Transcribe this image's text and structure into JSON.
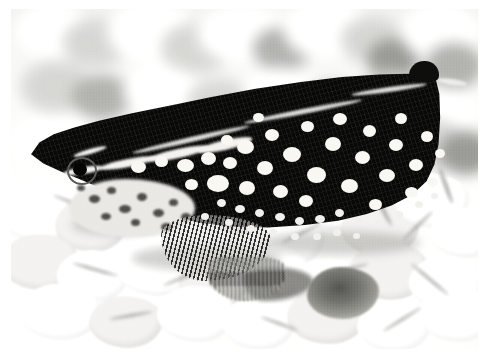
{
  "image": {
    "kind": "photograph",
    "medium": "black-and-white halftone print",
    "caption": "",
    "subject": "spotted fish resting on light aquarium gravel",
    "orientation": "landscape",
    "canvas": {
      "width": 494,
      "height": 363,
      "background": "#ffffff"
    },
    "plate": {
      "left": 11,
      "top": 9,
      "width": 467,
      "height": 340
    }
  },
  "palette": {
    "paper_white": "#ffffff",
    "gravel_white": "#fbfbfa",
    "gravel_midtone": "#cfcfcc",
    "gravel_shadow": "#8b8b87",
    "dark_pebble": "#6d6d68",
    "fish_body": "#0d0d0c",
    "fish_spot": "#f4f3ef",
    "fish_cheek": "#e6e5e1",
    "fin_ray": "#5c5b56"
  },
  "scene": {
    "background_label": "out-of-focus gravel",
    "foreground_label": "in-focus white gravel",
    "background_stones": [
      {
        "x": 4,
        "y": -6,
        "w": 74,
        "h": 56,
        "tone": "l"
      },
      {
        "x": 52,
        "y": 10,
        "w": 66,
        "h": 48,
        "tone": ""
      },
      {
        "x": 96,
        "y": -8,
        "w": 88,
        "h": 62,
        "tone": "l"
      },
      {
        "x": 150,
        "y": 14,
        "w": 70,
        "h": 50,
        "tone": ""
      },
      {
        "x": 186,
        "y": -4,
        "w": 92,
        "h": 58,
        "tone": "l"
      },
      {
        "x": 242,
        "y": 18,
        "w": 58,
        "h": 44,
        "tone": "d"
      },
      {
        "x": 272,
        "y": -10,
        "w": 86,
        "h": 60,
        "tone": "l"
      },
      {
        "x": 330,
        "y": 8,
        "w": 62,
        "h": 46,
        "tone": ""
      },
      {
        "x": 356,
        "y": 30,
        "w": 52,
        "h": 40,
        "tone": "dd"
      },
      {
        "x": 390,
        "y": -6,
        "w": 80,
        "h": 58,
        "tone": "l"
      },
      {
        "x": 414,
        "y": 34,
        "w": 58,
        "h": 46,
        "tone": "d"
      },
      {
        "x": 10,
        "y": 52,
        "w": 70,
        "h": 52,
        "tone": ""
      },
      {
        "x": 60,
        "y": 66,
        "w": 62,
        "h": 44,
        "tone": "d"
      },
      {
        "x": 112,
        "y": 56,
        "w": 76,
        "h": 52,
        "tone": "l"
      },
      {
        "x": 176,
        "y": 70,
        "w": 64,
        "h": 46,
        "tone": ""
      },
      {
        "x": 232,
        "y": 58,
        "w": 72,
        "h": 50,
        "tone": "l"
      },
      {
        "x": 292,
        "y": 74,
        "w": 58,
        "h": 44,
        "tone": "d"
      },
      {
        "x": 344,
        "y": 62,
        "w": 70,
        "h": 50,
        "tone": ""
      },
      {
        "x": 404,
        "y": 78,
        "w": 62,
        "h": 46,
        "tone": "l"
      },
      {
        "x": 2,
        "y": 104,
        "w": 84,
        "h": 54,
        "tone": "l"
      },
      {
        "x": 74,
        "y": 116,
        "w": 66,
        "h": 46,
        "tone": ""
      },
      {
        "x": 136,
        "y": 108,
        "w": 58,
        "h": 42,
        "tone": "d"
      },
      {
        "x": 382,
        "y": 110,
        "w": 74,
        "h": 52,
        "tone": ""
      },
      {
        "x": 428,
        "y": 122,
        "w": 54,
        "h": 44,
        "tone": "dd"
      }
    ],
    "foreground_pebbles": [
      {
        "x": -14,
        "y": 8,
        "w": 86,
        "h": 62,
        "shade": false
      },
      {
        "x": 44,
        "y": 26,
        "w": 72,
        "h": 54,
        "shade": true
      },
      {
        "x": 96,
        "y": 6,
        "w": 80,
        "h": 58,
        "shade": false
      },
      {
        "x": 150,
        "y": 34,
        "w": 76,
        "h": 56,
        "shade": false
      },
      {
        "x": 196,
        "y": 10,
        "w": 68,
        "h": 52,
        "shade": true
      },
      {
        "x": 240,
        "y": 40,
        "w": 74,
        "h": 54,
        "shade": false
      },
      {
        "x": 288,
        "y": 6,
        "w": 70,
        "h": 52,
        "shade": false
      },
      {
        "x": 330,
        "y": 28,
        "w": 78,
        "h": 56,
        "shade": true
      },
      {
        "x": 384,
        "y": 2,
        "w": 74,
        "h": 54,
        "shade": false
      },
      {
        "x": 420,
        "y": 36,
        "w": 66,
        "h": 50,
        "shade": false
      },
      {
        "x": -10,
        "y": 62,
        "w": 78,
        "h": 56,
        "shade": true
      },
      {
        "x": 46,
        "y": 78,
        "w": 72,
        "h": 52,
        "shade": false
      },
      {
        "x": 104,
        "y": 66,
        "w": 84,
        "h": 58,
        "shade": false
      },
      {
        "x": 168,
        "y": 84,
        "w": 70,
        "h": 52,
        "shade": true
      },
      {
        "x": 222,
        "y": 70,
        "w": 76,
        "h": 56,
        "shade": false
      },
      {
        "x": 282,
        "y": 86,
        "w": 72,
        "h": 52,
        "shade": false
      },
      {
        "x": 338,
        "y": 70,
        "w": 80,
        "h": 58,
        "shade": true
      },
      {
        "x": 398,
        "y": 84,
        "w": 74,
        "h": 54,
        "shade": false
      },
      {
        "x": 8,
        "y": 112,
        "w": 82,
        "h": 56,
        "shade": false
      },
      {
        "x": 78,
        "y": 124,
        "w": 74,
        "h": 52,
        "shade": true
      },
      {
        "x": 146,
        "y": 114,
        "w": 78,
        "h": 56,
        "shade": false
      },
      {
        "x": 212,
        "y": 126,
        "w": 72,
        "h": 52,
        "shade": false
      },
      {
        "x": 276,
        "y": 116,
        "w": 80,
        "h": 56,
        "shade": true
      },
      {
        "x": 346,
        "y": 128,
        "w": 74,
        "h": 52,
        "shade": false
      },
      {
        "x": 408,
        "y": 114,
        "w": 76,
        "h": 56,
        "shade": false
      }
    ],
    "pebble_seams": [
      {
        "x": 40,
        "y": 30,
        "w": 46,
        "h": 3,
        "rot": 22
      },
      {
        "x": 118,
        "y": 52,
        "w": 40,
        "h": 3,
        "rot": -18
      },
      {
        "x": 196,
        "y": 38,
        "w": 52,
        "h": 3,
        "rot": 12
      },
      {
        "x": 268,
        "y": 60,
        "w": 44,
        "h": 3,
        "rot": -26
      },
      {
        "x": 344,
        "y": 30,
        "w": 50,
        "h": 4,
        "rot": 62
      },
      {
        "x": 386,
        "y": 52,
        "w": 42,
        "h": 3,
        "rot": -44
      },
      {
        "x": 416,
        "y": 12,
        "w": 38,
        "h": 4,
        "rot": 70
      },
      {
        "x": 60,
        "y": 96,
        "w": 48,
        "h": 3,
        "rot": 16
      },
      {
        "x": 150,
        "y": 104,
        "w": 44,
        "h": 3,
        "rot": -22
      },
      {
        "x": 232,
        "y": 112,
        "w": 40,
        "h": 3,
        "rot": 30
      },
      {
        "x": 312,
        "y": 96,
        "w": 46,
        "h": 3,
        "rot": -14
      },
      {
        "x": 394,
        "y": 106,
        "w": 50,
        "h": 3,
        "rot": 40
      },
      {
        "x": 98,
        "y": 142,
        "w": 44,
        "h": 3,
        "rot": -10
      },
      {
        "x": 248,
        "y": 150,
        "w": 40,
        "h": 3,
        "rot": 20
      },
      {
        "x": 368,
        "y": 146,
        "w": 46,
        "h": 3,
        "rot": -32
      }
    ],
    "dark_pebble": {
      "x": 296,
      "y": 258,
      "w": 72,
      "h": 52
    },
    "contact_shadows": [
      {
        "x": 120,
        "y": 236,
        "w": 150,
        "h": 26
      },
      {
        "x": 250,
        "y": 222,
        "w": 160,
        "h": 24
      },
      {
        "x": 60,
        "y": 206,
        "w": 90,
        "h": 20
      }
    ]
  },
  "fish": {
    "label": "spotted fish",
    "body": {
      "x": 18,
      "y": 58,
      "w": 412,
      "h": 168,
      "color": "#0d0d0c"
    },
    "dorsal_lobe": {
      "x": 398,
      "y": 52,
      "w": 30,
      "h": 20
    },
    "dorsal_rim": [
      {
        "x": 120,
        "y": 128,
        "w": 120,
        "h": 5,
        "rot": -13
      },
      {
        "x": 232,
        "y": 100,
        "w": 120,
        "h": 5,
        "rot": -11
      },
      {
        "x": 340,
        "y": 78,
        "w": 76,
        "h": 5,
        "rot": -8
      },
      {
        "x": 426,
        "y": 70,
        "w": 30,
        "h": 6,
        "rot": 8
      }
    ],
    "head_stripes": [
      {
        "x": 52,
        "y": 158,
        "w": 40,
        "h": 7,
        "rot": -9,
        "label": "snout-bar"
      },
      {
        "x": 88,
        "y": 150,
        "w": 58,
        "h": 8,
        "rot": -11,
        "label": "supraorbital-stripe"
      },
      {
        "x": 136,
        "y": 140,
        "w": 62,
        "h": 9,
        "rot": -12,
        "label": "mid-lateral-stripe"
      },
      {
        "x": 186,
        "y": 131,
        "w": 56,
        "h": 10,
        "rot": -13,
        "label": "lateral-stripe-2"
      },
      {
        "x": 62,
        "y": 140,
        "w": 34,
        "h": 5,
        "rot": -16,
        "label": "upper-brow-stripe"
      }
    ],
    "cheek": {
      "x": 58,
      "y": 170,
      "w": 126,
      "h": 58
    },
    "cheek_mottles": [
      {
        "x": 78,
        "y": 186,
        "w": 11,
        "h": 8
      },
      {
        "x": 96,
        "y": 178,
        "w": 9,
        "h": 7
      },
      {
        "x": 108,
        "y": 196,
        "w": 12,
        "h": 8
      },
      {
        "x": 126,
        "y": 184,
        "w": 10,
        "h": 8
      },
      {
        "x": 142,
        "y": 200,
        "w": 11,
        "h": 8
      },
      {
        "x": 158,
        "y": 190,
        "w": 9,
        "h": 7
      },
      {
        "x": 90,
        "y": 204,
        "w": 10,
        "h": 7
      },
      {
        "x": 120,
        "y": 210,
        "w": 9,
        "h": 7
      },
      {
        "x": 150,
        "y": 214,
        "w": 11,
        "h": 8
      },
      {
        "x": 170,
        "y": 204,
        "w": 10,
        "h": 8
      },
      {
        "x": 66,
        "y": 176,
        "w": 8,
        "h": 6
      }
    ],
    "eye": {
      "ring_x": 56,
      "ring_y": 148,
      "ring_w": 26,
      "ring_h": 24,
      "pupil_x": 62,
      "pupil_y": 154,
      "pupil_w": 14,
      "pupil_h": 13
    },
    "spots": [
      {
        "x": 120,
        "y": 152,
        "w": 15,
        "h": 12
      },
      {
        "x": 144,
        "y": 147,
        "w": 13,
        "h": 11
      },
      {
        "x": 166,
        "y": 150,
        "w": 17,
        "h": 13
      },
      {
        "x": 190,
        "y": 143,
        "w": 15,
        "h": 13
      },
      {
        "x": 212,
        "y": 148,
        "w": 14,
        "h": 12
      },
      {
        "x": 196,
        "y": 166,
        "w": 22,
        "h": 17
      },
      {
        "x": 226,
        "y": 131,
        "w": 17,
        "h": 14
      },
      {
        "x": 246,
        "y": 152,
        "w": 16,
        "h": 14
      },
      {
        "x": 228,
        "y": 172,
        "w": 16,
        "h": 14
      },
      {
        "x": 254,
        "y": 120,
        "w": 14,
        "h": 12
      },
      {
        "x": 272,
        "y": 138,
        "w": 18,
        "h": 15
      },
      {
        "x": 262,
        "y": 176,
        "w": 15,
        "h": 13
      },
      {
        "x": 290,
        "y": 112,
        "w": 13,
        "h": 11
      },
      {
        "x": 296,
        "y": 158,
        "w": 19,
        "h": 16
      },
      {
        "x": 288,
        "y": 186,
        "w": 14,
        "h": 12
      },
      {
        "x": 314,
        "y": 128,
        "w": 16,
        "h": 14
      },
      {
        "x": 322,
        "y": 104,
        "w": 14,
        "h": 12
      },
      {
        "x": 330,
        "y": 170,
        "w": 17,
        "h": 14
      },
      {
        "x": 344,
        "y": 142,
        "w": 15,
        "h": 13
      },
      {
        "x": 352,
        "y": 116,
        "w": 13,
        "h": 12
      },
      {
        "x": 358,
        "y": 190,
        "w": 13,
        "h": 11
      },
      {
        "x": 368,
        "y": 160,
        "w": 16,
        "h": 13
      },
      {
        "x": 378,
        "y": 130,
        "w": 14,
        "h": 12
      },
      {
        "x": 384,
        "y": 104,
        "w": 12,
        "h": 11
      },
      {
        "x": 394,
        "y": 178,
        "w": 13,
        "h": 11
      },
      {
        "x": 398,
        "y": 150,
        "w": 14,
        "h": 12
      },
      {
        "x": 410,
        "y": 122,
        "w": 12,
        "h": 11
      },
      {
        "x": 416,
        "y": 168,
        "w": 11,
        "h": 10
      },
      {
        "x": 424,
        "y": 140,
        "w": 10,
        "h": 9
      },
      {
        "x": 242,
        "y": 104,
        "w": 11,
        "h": 9
      },
      {
        "x": 210,
        "y": 126,
        "w": 12,
        "h": 10
      },
      {
        "x": 174,
        "y": 170,
        "w": 13,
        "h": 11
      }
    ],
    "small_spots": [
      {
        "x": 206,
        "y": 190,
        "w": 9,
        "h": 8
      },
      {
        "x": 224,
        "y": 196,
        "w": 10,
        "h": 8
      },
      {
        "x": 244,
        "y": 200,
        "w": 9,
        "h": 8
      },
      {
        "x": 264,
        "y": 204,
        "w": 10,
        "h": 8
      },
      {
        "x": 284,
        "y": 208,
        "w": 9,
        "h": 8
      },
      {
        "x": 304,
        "y": 206,
        "w": 10,
        "h": 8
      },
      {
        "x": 324,
        "y": 200,
        "w": 9,
        "h": 8
      },
      {
        "x": 344,
        "y": 208,
        "w": 9,
        "h": 8
      },
      {
        "x": 364,
        "y": 210,
        "w": 8,
        "h": 7
      },
      {
        "x": 384,
        "y": 202,
        "w": 8,
        "h": 7
      },
      {
        "x": 214,
        "y": 210,
        "w": 8,
        "h": 7
      },
      {
        "x": 236,
        "y": 216,
        "w": 8,
        "h": 7
      },
      {
        "x": 258,
        "y": 220,
        "w": 8,
        "h": 7
      },
      {
        "x": 280,
        "y": 224,
        "w": 8,
        "h": 7
      },
      {
        "x": 302,
        "y": 224,
        "w": 8,
        "h": 7
      },
      {
        "x": 322,
        "y": 220,
        "w": 8,
        "h": 7
      },
      {
        "x": 342,
        "y": 224,
        "w": 7,
        "h": 6
      },
      {
        "x": 190,
        "y": 204,
        "w": 8,
        "h": 7
      },
      {
        "x": 404,
        "y": 192,
        "w": 8,
        "h": 7
      },
      {
        "x": 420,
        "y": 184,
        "w": 7,
        "h": 6
      }
    ],
    "pectoral_fin": {
      "x": 150,
      "y": 206,
      "w": 110,
      "h": 66
    },
    "pelvic_fin": {
      "x": 196,
      "y": 248,
      "w": 78,
      "h": 44
    },
    "anal_shadow": {
      "x": 232,
      "y": 258,
      "w": 70,
      "h": 34
    }
  }
}
